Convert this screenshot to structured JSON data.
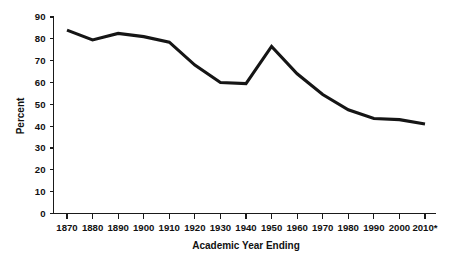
{
  "chart_data": {
    "type": "line",
    "title": "",
    "subtitle": "",
    "xlabel": "Academic Year Ending",
    "ylabel": "Percent",
    "categories": [
      "1870",
      "1880",
      "1890",
      "1900",
      "1910",
      "1920",
      "1930",
      "1940",
      "1950",
      "1960",
      "1970",
      "1980",
      "1990",
      "2000",
      "2010*"
    ],
    "x": [
      1870,
      1880,
      1890,
      1900,
      1910,
      1920,
      1930,
      1940,
      1950,
      1960,
      1970,
      1980,
      1990,
      2000,
      2010
    ],
    "values": [
      84,
      79.5,
      82.5,
      81,
      78.5,
      68,
      60,
      59.5,
      76.5,
      64,
      54.5,
      47.5,
      43.5,
      43,
      41
    ],
    "series": [
      {
        "name": "Percent",
        "color": "#151515",
        "values": [
          84,
          79.5,
          82.5,
          81,
          78.5,
          68,
          60,
          59.5,
          76.5,
          64,
          54.5,
          47.5,
          43.5,
          43,
          41
        ]
      }
    ],
    "ylim": [
      0,
      90
    ],
    "xlim": [
      1870,
      2010
    ],
    "ytick_labels": [
      "0",
      "10",
      "20",
      "30",
      "40",
      "50",
      "60",
      "70",
      "80",
      "90"
    ],
    "yticks": [
      0,
      10,
      20,
      30,
      40,
      50,
      60,
      70,
      80,
      90
    ],
    "grid": false,
    "legend": false,
    "legend_position": "none",
    "annotations": [],
    "footnote_marker": "*",
    "line_color": "#151515",
    "axis_color": "#1a1a1a",
    "background_color": "#ffffff"
  },
  "axes": {
    "y_axis_title": "Percent",
    "x_axis_title": "Academic Year Ending"
  }
}
